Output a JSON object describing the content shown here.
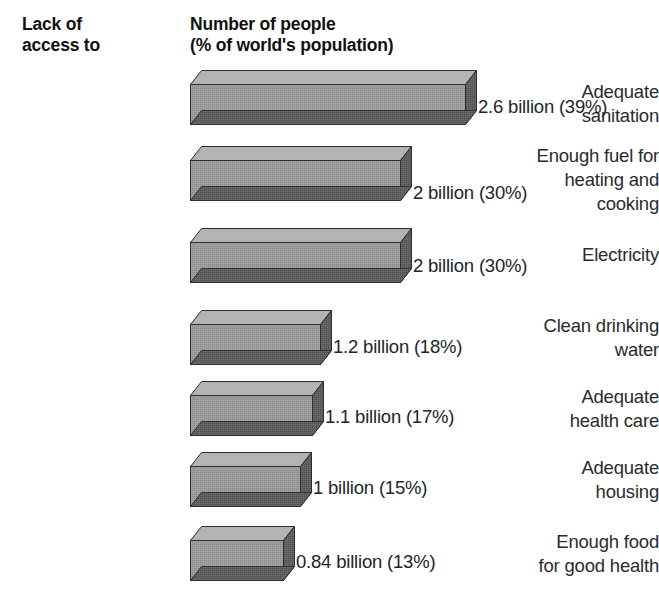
{
  "headers": {
    "category": "Lack of\naccess to",
    "value": "Number of people\n(% of world's population)"
  },
  "colors": {
    "bar_front": "#9a9a9a",
    "bar_top": "#b3b3b3",
    "bar_shadow": "#5e5e5e",
    "bar_outline": "#2e2e2e",
    "background": "#ffffff",
    "text": "#242424"
  },
  "chart_data": {
    "type": "bar",
    "orientation": "horizontal",
    "style": "3d-isometric",
    "title": "",
    "xlabel": "Number of people (% of world's population)",
    "ylabel": "Lack of access to",
    "grid": false,
    "legend": null,
    "units": "billions of people",
    "categories": [
      "Adequate\nsanitation",
      "Enough fuel for\nheating and\ncooking",
      "Electricity",
      "Clean drinking\nwater",
      "Adequate\nhealth care",
      "Adequate\nhousing",
      "Enough food\nfor good health"
    ],
    "values": [
      2.6,
      2,
      2,
      1.2,
      1.1,
      1,
      0.84
    ],
    "percents": [
      39,
      30,
      30,
      18,
      17,
      15,
      13
    ],
    "value_labels": [
      "2.6 billion (39%)",
      "2 billion (30%)",
      "2 billion (30%)",
      "1.2 billion (18%)",
      "1.1 billion (17%)",
      "1 billion (15%)",
      "0.84 billion (13%)"
    ],
    "xlim": [
      0,
      2.6
    ]
  },
  "rows": [
    {
      "label": "Adequate\nsanitation",
      "value_label": "2.6 billion (39%)",
      "value": 2.6,
      "percent": 39,
      "top": 70,
      "label_top": 80,
      "bar_width": 275,
      "value_left": 478,
      "value_top": 96
    },
    {
      "label": "Enough fuel for\nheating and\ncooking",
      "value_label": "2 billion (30%)",
      "value": 2,
      "percent": 30,
      "top": 146,
      "label_top": 144,
      "bar_width": 210,
      "value_left": 413,
      "value_top": 182
    },
    {
      "label": "Electricity",
      "value_label": "2 billion (30%)",
      "value": 2,
      "percent": 30,
      "top": 228,
      "label_top": 243,
      "bar_width": 210,
      "value_left": 413,
      "value_top": 255
    },
    {
      "label": "Clean drinking\nwater",
      "value_label": "1.2 billion (18%)",
      "value": 1.2,
      "percent": 18,
      "top": 310,
      "label_top": 314,
      "bar_width": 130,
      "value_left": 333,
      "value_top": 336
    },
    {
      "label": "Adequate\nhealth care",
      "value_label": "1.1 billion (17%)",
      "value": 1.1,
      "percent": 17,
      "top": 381,
      "label_top": 385,
      "bar_width": 122,
      "value_left": 325,
      "value_top": 406
    },
    {
      "label": "Adequate\nhousing",
      "value_label": "1 billion (15%)",
      "value": 1,
      "percent": 15,
      "top": 452,
      "label_top": 456,
      "bar_width": 110,
      "value_left": 313,
      "value_top": 477
    },
    {
      "label": "Enough food\nfor good health",
      "value_label": "0.84 billion (13%)",
      "value": 0.84,
      "percent": 13,
      "top": 526,
      "label_top": 530,
      "bar_width": 93,
      "value_left": 296,
      "value_top": 551
    }
  ],
  "bar_geometry": {
    "left": 190,
    "front_height": 40,
    "depth_x": 11,
    "depth_y": 14
  }
}
